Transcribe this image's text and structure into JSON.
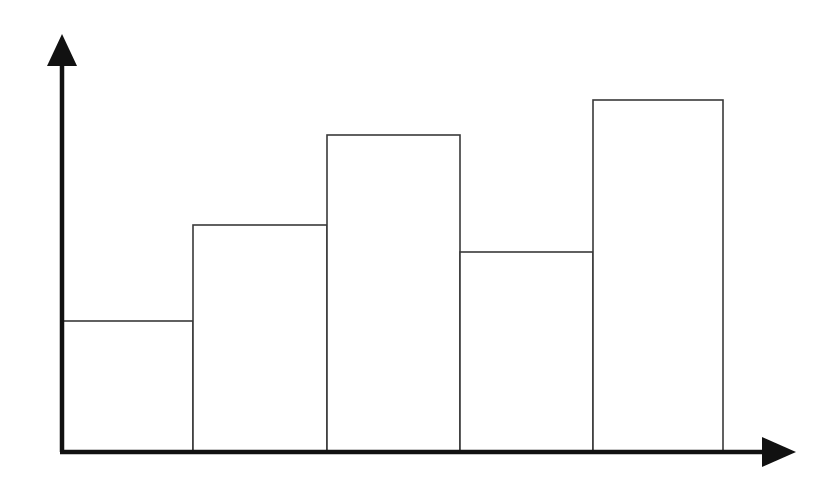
{
  "chart_data": {
    "type": "bar",
    "title": "",
    "subtitle": "",
    "xlabel": "",
    "ylabel": "",
    "categories": [
      "1",
      "2",
      "3",
      "4",
      "5"
    ],
    "values": [
      131,
      227,
      317,
      200,
      352
    ],
    "xlim": [
      0,
      5
    ],
    "ylim": [
      0,
      417
    ],
    "grid": false,
    "legend": null,
    "tick_labels": {
      "x": [],
      "y": []
    },
    "annotations": [],
    "style": {
      "bar_fill": "#ffffff",
      "bar_stroke": "#3a3a3a",
      "bar_stroke_width": 1.6,
      "axis_color": "#111111",
      "axis_width": 4.5,
      "background": "#ffffff",
      "bars_adjacent": true,
      "arrow_heads": true
    },
    "geometry": {
      "baseline_y": 452,
      "axis_x": 62,
      "plot_right": 795,
      "y_axis_top": 35,
      "bar_edges_x": [
        62,
        193,
        327,
        460,
        593,
        723
      ],
      "bar_tops_y": [
        321,
        225,
        135,
        252,
        100
      ]
    }
  },
  "figure": {
    "name": "bar-chart",
    "width": 840,
    "height": 481,
    "x_axis_name": "horizontal-axis",
    "y_axis_name": "vertical-axis"
  }
}
